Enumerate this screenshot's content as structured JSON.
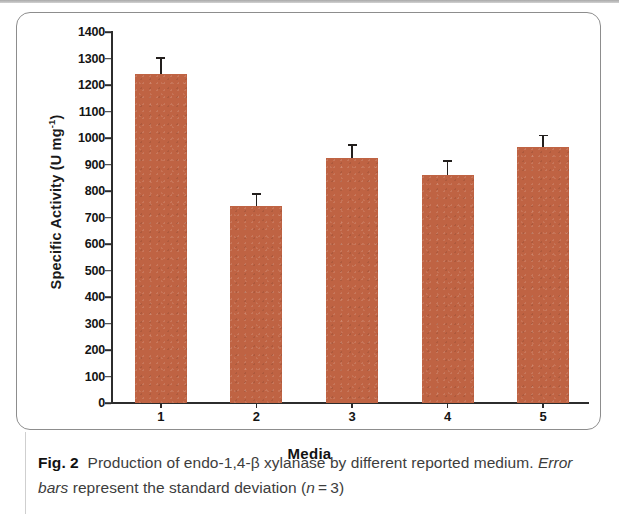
{
  "figure": {
    "caption_label": "Fig. 2",
    "caption_part1": "Production of endo-1,4-β xylanase by different reported medium.",
    "caption_emphasis": "Error bars",
    "caption_part2": "represent the standard deviation (",
    "caption_var": "n",
    "caption_part3": " = 3)"
  },
  "colors": {
    "bar_fill": "#bf6343",
    "axis": "#2c2c2c",
    "error_bar": "#231f1d",
    "card_border": "#8d8d8d",
    "caption_text": "#3d3d3d"
  },
  "chart_data": {
    "type": "bar",
    "title": "",
    "xlabel": "Media",
    "ylabel": "Specific Activity (U mg-1)",
    "ylabel_base": "Specific Activity (U mg",
    "ylabel_sup": "-1",
    "ylabel_close": ")",
    "categories": [
      "1",
      "2",
      "3",
      "4",
      "5"
    ],
    "values": [
      1240,
      745,
      925,
      860,
      965
    ],
    "errors": [
      65,
      48,
      52,
      58,
      48
    ],
    "ylim": [
      0,
      1400
    ],
    "ytick_step": 100,
    "ytick_labels": [
      "1400",
      "1300",
      "1200",
      "1100",
      "1000",
      "900",
      "800",
      "700",
      "600",
      "500",
      "400",
      "300",
      "200",
      "100",
      "0"
    ],
    "ytick_values": [
      1400,
      1300,
      1200,
      1100,
      1000,
      900,
      800,
      700,
      600,
      500,
      400,
      300,
      200,
      100,
      0
    ],
    "grid": false,
    "legend": null,
    "error_bar_note": "standard deviation, n = 3"
  }
}
